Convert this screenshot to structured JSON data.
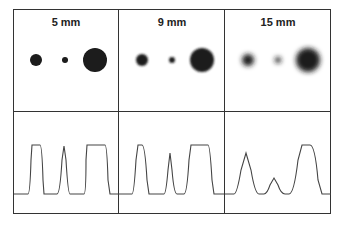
{
  "panels": [
    {
      "label": "5 mm",
      "blur": 0.6,
      "dots": [
        {
          "cx": 36,
          "cy": 60,
          "r": 6
        },
        {
          "cx": 65,
          "cy": 60,
          "r": 3
        },
        {
          "cx": 95,
          "cy": 60,
          "r": 12
        }
      ]
    },
    {
      "label": "9 mm",
      "blur": 1.3,
      "dots": [
        {
          "cx": 142,
          "cy": 60,
          "r": 6
        },
        {
          "cx": 172,
          "cy": 60,
          "r": 3
        },
        {
          "cx": 202,
          "cy": 60,
          "r": 12
        }
      ]
    },
    {
      "label": "15 mm",
      "blur": 2.4,
      "dots": [
        {
          "cx": 248,
          "cy": 60,
          "r": 6
        },
        {
          "cx": 278,
          "cy": 60,
          "r": 3
        },
        {
          "cx": 308,
          "cy": 60,
          "r": 12
        }
      ]
    }
  ],
  "profiles": [
    "M14,194 L28,194 Q30,194 31,160 L32,145 L40,145 Q42,145 43,180 L44,194 L57,194 Q60,194 62,160 L64,146 L66,160 Q68,194 70,194 L84,194 Q86,194 86,160 L87,145 L105,145 Q107,145 108,180 L110,194 L119,194",
    "M119,194 L132,194 Q134,194 136,160 L138,145 L142,145 Q145,145 147,180 L149,194 L164,194 Q166,194 168,170 L170,153 L172,170 Q174,194 177,194 L184,194 Q187,194 189,160 L191,145 L208,145 Q210,145 212,180 L214,194 L224,194",
    "M225,194 L234,194 Q237,194 241,170 L246,153 L251,170 Q255,194 259,194 L264,194 Q267,194 270,185 L274,178 L278,185 Q281,194 285,194 L289,194 Q294,194 298,160 L302,145 L310,145 Q315,145 318,180 L322,194 L331,194"
  ]
}
